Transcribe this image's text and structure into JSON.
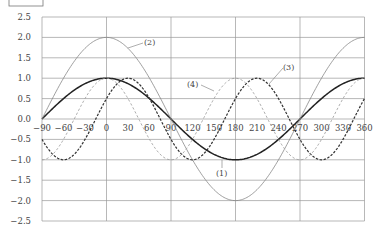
{
  "chart_data": {
    "type": "line",
    "title": "",
    "xlabel": "",
    "ylabel": "",
    "xlim": [
      -90,
      360
    ],
    "ylim": [
      -2.5,
      2.5
    ],
    "grid": true,
    "x_ticks": [
      -90,
      -60,
      -30,
      0,
      30,
      60,
      90,
      120,
      150,
      180,
      210,
      240,
      270,
      300,
      330,
      360
    ],
    "x_tick_labels": [
      "−90",
      "−60",
      "−30",
      "0",
      "30",
      "60",
      "90",
      "120",
      "150",
      "180",
      "210",
      "240",
      "270",
      "300",
      "330",
      "360"
    ],
    "x_gridlines": [
      -90,
      0,
      90,
      180,
      270,
      360
    ],
    "y_ticks": [
      2.5,
      2.0,
      1.5,
      1.0,
      0.5,
      0.0,
      -0.5,
      -1.0,
      -1.5,
      -2.0,
      -2.5
    ],
    "y_tick_labels": [
      "2.5",
      "2.0",
      "1.5",
      "1.0",
      "0.5",
      "0.0",
      "−0.5",
      "−1.0",
      "−1.5",
      "−2.0",
      "−2.5"
    ],
    "legend_position": "inline annotations",
    "x": [
      -90,
      -60,
      -30,
      0,
      30,
      60,
      90,
      120,
      150,
      180,
      210,
      240,
      270,
      300,
      330,
      360
    ],
    "series": [
      {
        "name": "(1)",
        "formula": "cos(x)",
        "style": "solid-thick",
        "color": "#222222",
        "values": [
          0,
          0.5,
          0.87,
          1,
          0.87,
          0.5,
          0,
          -0.5,
          -0.87,
          -1,
          -0.87,
          -0.5,
          0,
          0.5,
          0.87,
          1
        ]
      },
      {
        "name": "(2)",
        "formula": "2cos(x)",
        "style": "solid-thin",
        "color": "#888888",
        "values": [
          0,
          1,
          1.73,
          2,
          1.73,
          1,
          0,
          -1,
          -1.73,
          -2,
          -1.73,
          -1,
          0,
          1,
          1.73,
          2
        ]
      },
      {
        "name": "(3)",
        "formula": "cos(2x-60)",
        "style": "dashed-dark",
        "color": "#333333",
        "values": [
          -0.5,
          -1,
          -0.5,
          0.5,
          1,
          0.5,
          -0.5,
          -1,
          -0.5,
          0.5,
          1,
          0.5,
          -0.5,
          -1,
          -0.5,
          0.5
        ]
      },
      {
        "name": "(4)",
        "formula": "cos(2x)",
        "style": "dashed-light",
        "color": "#999999",
        "values": [
          -1,
          -0.5,
          0.5,
          1,
          0.5,
          -0.5,
          -1,
          -0.5,
          0.5,
          1,
          0.5,
          -0.5,
          -1,
          -0.5,
          0.5,
          1
        ]
      }
    ],
    "annotations": [
      {
        "text": "(1)",
        "near_x": 180,
        "near_y": -1.4
      },
      {
        "text": "(2)",
        "near_x": 90,
        "near_y": 1.85
      },
      {
        "text": "(3)",
        "near_x": 240,
        "near_y": 1.25
      },
      {
        "text": "(4)",
        "near_x": 120,
        "near_y": 0.85
      }
    ]
  },
  "labels": {
    "curve1": "(1)",
    "curve2": "(2)",
    "curve3": "(3)",
    "curve4": "(4)"
  }
}
